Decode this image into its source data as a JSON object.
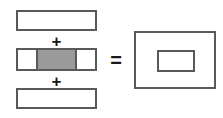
{
  "diagram": {
    "background_color": "#ffffff",
    "stroke_color": "#595959",
    "fill_gray": "#9a9a9a",
    "fill_white": "#ffffff",
    "operands": [
      {
        "id": "top-bar",
        "label": "",
        "shape": "rectangle",
        "fill": "#ffffff"
      },
      {
        "id": "middle-bar",
        "label": "",
        "shape": "segmented-rectangle",
        "segments": [
          {
            "id": "left-cap",
            "fill": "#ffffff",
            "label": ""
          },
          {
            "id": "center-fill",
            "fill": "#9a9a9a",
            "label": ""
          },
          {
            "id": "right-cap",
            "fill": "#ffffff",
            "label": ""
          }
        ]
      },
      {
        "id": "bottom-bar",
        "label": "",
        "shape": "rectangle",
        "fill": "#ffffff"
      }
    ],
    "operators": {
      "plus_1": "+",
      "plus_2": "+",
      "equals": "="
    },
    "result": {
      "id": "result-box",
      "label": "",
      "outer": {
        "shape": "rectangle",
        "fill": "#ffffff"
      },
      "inner": {
        "shape": "rectangle",
        "fill": "#ffffff",
        "label": ""
      }
    }
  }
}
